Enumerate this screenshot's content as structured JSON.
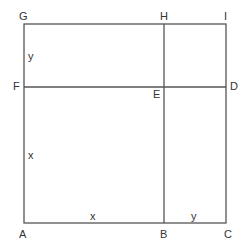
{
  "diagram": {
    "line_color": "#555555",
    "points": {
      "A": {
        "label": "A"
      },
      "B": {
        "label": "B"
      },
      "C": {
        "label": "C"
      },
      "D": {
        "label": "D"
      },
      "E": {
        "label": "E"
      },
      "F": {
        "label": "F"
      },
      "G": {
        "label": "G"
      },
      "H": {
        "label": "H"
      },
      "I": {
        "label": "I"
      }
    },
    "segment_labels": {
      "AB": "x",
      "BC": "y",
      "AF": "x",
      "FG": "y"
    }
  }
}
